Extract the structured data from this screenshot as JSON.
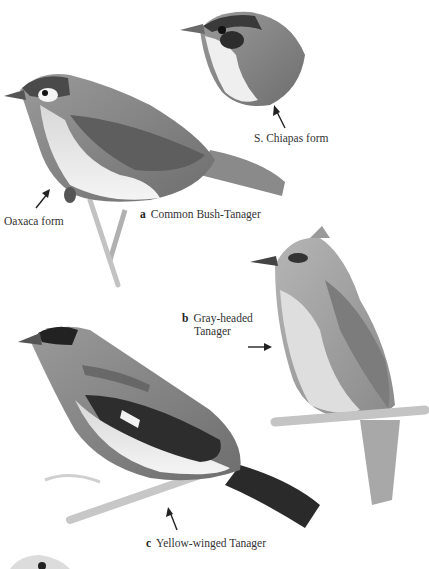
{
  "plate": {
    "species": [
      {
        "letter": "a",
        "name": "Common Bush-Tanager"
      },
      {
        "letter": "b",
        "name_line1": "Gray-headed",
        "name_line2": "Tanager"
      },
      {
        "letter": "c",
        "name": "Yellow-winged Tanager"
      }
    ],
    "forms": [
      {
        "label": "S. Chiapas form"
      },
      {
        "label": "Oaxaca form"
      }
    ],
    "colors": {
      "background": "#ffffff",
      "text": "#333333",
      "bird_dark": "#2b2b2b",
      "bird_mid": "#7a7a7a",
      "bird_light": "#c9c9c9"
    }
  }
}
